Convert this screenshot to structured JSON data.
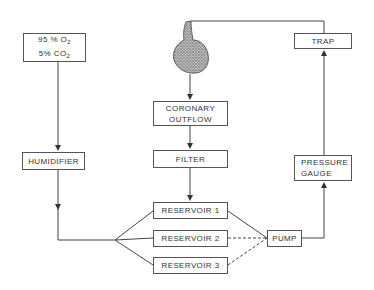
{
  "diagram": {
    "gas_source": {
      "line1": "95 % O",
      "line1_sub": "2",
      "line2": "5% CO",
      "line2_sub": "2"
    },
    "humidifier": {
      "label": "HUMIDIFIER"
    },
    "heart": {
      "icon": "heart-icon"
    },
    "coronary_outflow": {
      "line1": "CORONARY",
      "line2": "OUTFLOW"
    },
    "filter": {
      "label": "FILTER"
    },
    "reservoirs": [
      {
        "label": "RESERVOIR 1"
      },
      {
        "label": "RESERVOIR 2"
      },
      {
        "label": "RESERVOIR 3"
      }
    ],
    "pump": {
      "label": "PUMP"
    },
    "pressure_gauge": {
      "line1": "PRESSURE",
      "line2": "GAUGE"
    },
    "trap": {
      "label": "TRAP"
    },
    "colors": {
      "line": "#444444",
      "box_border": "#555555",
      "heart": "#8a8a8a"
    }
  }
}
